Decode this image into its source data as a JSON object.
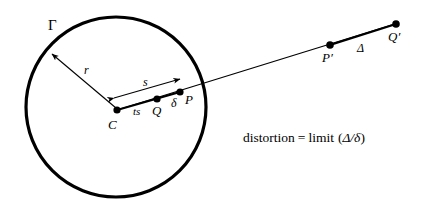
{
  "figure": {
    "title_alt": "Distortion of a radial mapping about a circle",
    "background_color": "#ffffff",
    "stroke_color": "#000000",
    "labels": {
      "gamma": "Γ",
      "radius": "r",
      "arc_s": "s",
      "ts": "ts",
      "center": "C",
      "point_q": "Q",
      "delta": "δ",
      "point_p": "P",
      "point_p_prime": "P′",
      "big_delta": "Δ",
      "point_q_prime": "Q′"
    },
    "formula": {
      "lhs": "distortion",
      "equals": "=",
      "operator": "limit",
      "open_paren": "(",
      "numerator": "Δ",
      "slash": "/",
      "denominator": "δ",
      "close_paren": ")",
      "full_text": "distortion = limit (Δ/δ)"
    },
    "geometry": {
      "circle": {
        "cx": 116,
        "cy": 107,
        "r": 90,
        "stroke_width": 3.2
      },
      "points": [
        {
          "name": "C",
          "x": 117,
          "y": 110,
          "radius": 3.6
        },
        {
          "name": "Q",
          "x": 157,
          "y": 99,
          "radius": 3.6
        },
        {
          "name": "P",
          "x": 180,
          "y": 92,
          "radius": 3.6
        },
        {
          "name": "P'",
          "x": 330,
          "y": 45,
          "radius": 3.6
        },
        {
          "name": "Q'",
          "x": 396,
          "y": 24,
          "radius": 3.6
        }
      ],
      "ray": {
        "x1": 117,
        "y1": 110,
        "x2": 398,
        "y2": 23
      },
      "radius_arrow": {
        "x1": 116,
        "y1": 108,
        "x2": 51,
        "y2": 53
      },
      "arc_arrow": {
        "x1": 113,
        "y1": 97,
        "x2": 181,
        "y2": 79
      }
    }
  }
}
